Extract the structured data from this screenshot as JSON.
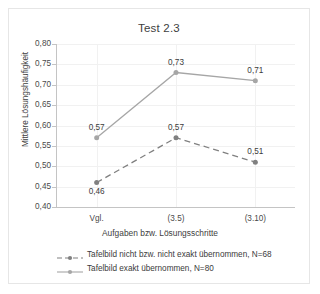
{
  "chart_data": {
    "type": "line",
    "title": "Test 2.3",
    "xlabel": "Aufgaben bzw. Lösungsschritte",
    "ylabel": "Mittlere Lösungshäufigkeit",
    "categories": [
      "Vgl.",
      "(3.5)",
      "(3.10)"
    ],
    "ylim": [
      0.4,
      0.8
    ],
    "yticks": [
      0.4,
      0.45,
      0.5,
      0.55,
      0.6,
      0.65,
      0.7,
      0.75,
      0.8
    ],
    "ytick_labels": [
      "0,40",
      "0,45",
      "0,50",
      "0,55",
      "0,60",
      "0,65",
      "0,70",
      "0,75",
      "0,80"
    ],
    "grid": true,
    "legend_position": "bottom",
    "series": [
      {
        "name": "Tafelbild nicht bzw. nicht exakt übernommen, N=68",
        "values": [
          0.46,
          0.57,
          0.51
        ],
        "labels": [
          "0,46",
          "0,57",
          "0,51"
        ],
        "style": "dashed",
        "color": "#808080"
      },
      {
        "name": "Tafelbild exakt übernommen, N=80",
        "values": [
          0.57,
          0.73,
          0.71
        ],
        "labels": [
          "0,57",
          "0,73",
          "0,71"
        ],
        "style": "solid",
        "color": "#a6a6a6"
      }
    ]
  },
  "legend": {
    "entries": [
      {
        "label": "Tafelbild nicht bzw. nicht exakt übernommen, N=68"
      },
      {
        "label": "Tafelbild exakt übernommen, N=80"
      }
    ]
  },
  "colors": {
    "series_dashed": "#808080",
    "series_solid": "#a6a6a6",
    "axis": "#c4c4c4",
    "grid": "#f1f1f1",
    "text": "#3b3b3b",
    "frame": "#e6e6e6"
  }
}
